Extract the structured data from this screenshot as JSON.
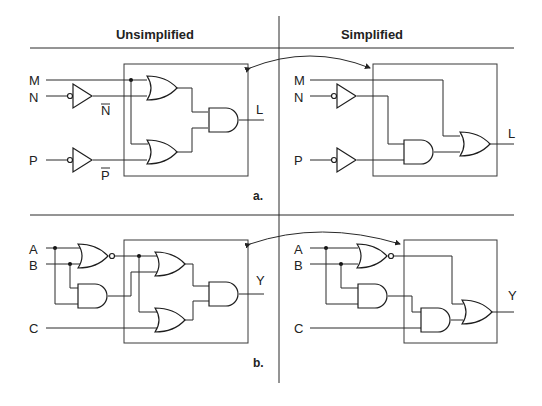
{
  "headers": {
    "left": "Unsimplified",
    "right": "Simplified"
  },
  "panel_a": {
    "caption": "a.",
    "inputs": [
      "M",
      "N",
      "P"
    ],
    "inverted_labels": [
      "N",
      "P"
    ],
    "output": "L",
    "unsimplified_gates": [
      "NOT(N)",
      "NOT(P)",
      "OR(M, N̄)",
      "OR(M, P̄)",
      "AND"
    ],
    "simplified_gates": [
      "NOT(N)",
      "NOT(P)",
      "AND(N̄, P̄)",
      "OR(M, N̄P̄)"
    ]
  },
  "panel_b": {
    "caption": "b.",
    "inputs": [
      "A",
      "B",
      "C"
    ],
    "output": "Y",
    "unsimplified_gates": [
      "NOR(A, B)",
      "AND(A, B)",
      "OR(NOR, AND)",
      "OR(NOR, C)",
      "AND"
    ],
    "simplified_gates": [
      "NOR(A, B)",
      "AND(A, B)",
      "AND(AND, C)",
      "OR(NOR, AND)"
    ]
  },
  "colors": {
    "line": "#2a2a2a",
    "background": "#ffffff"
  }
}
